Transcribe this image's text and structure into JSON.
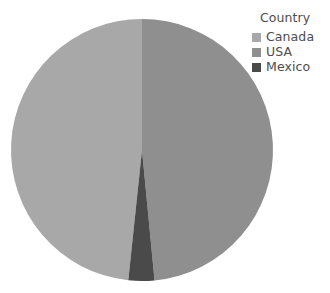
{
  "chart_data": {
    "type": "pie",
    "title": "",
    "legend_title": "Country",
    "legend_position": "top-right",
    "grid": false,
    "categories": [
      "Canada",
      "USA",
      "Mexico"
    ],
    "values": [
      48.5,
      48.5,
      3.0
    ],
    "value_unit": "percent",
    "slices": [
      {
        "label": "Canada",
        "value": 48.5,
        "color": "#a8a8a8",
        "start_angle_deg": 186,
        "end_angle_deg": 360
      },
      {
        "label": "USA",
        "value": 48.5,
        "color": "#8f8f8f",
        "start_angle_deg": 0,
        "end_angle_deg": 174.5
      },
      {
        "label": "Mexico",
        "value": 3.0,
        "color": "#4a4a4a",
        "start_angle_deg": 174.5,
        "end_angle_deg": 186
      }
    ],
    "geometry": {
      "center_x": 142,
      "center_y": 150,
      "radius": 131
    },
    "background_color": "#ffffff",
    "text_color": "#4d4d4d"
  },
  "legend": {
    "title": "Country",
    "items": [
      {
        "label": "Canada",
        "color": "#a8a8a8"
      },
      {
        "label": "USA",
        "color": "#8f8f8f"
      },
      {
        "label": "Mexico",
        "color": "#4a4a4a"
      }
    ]
  }
}
